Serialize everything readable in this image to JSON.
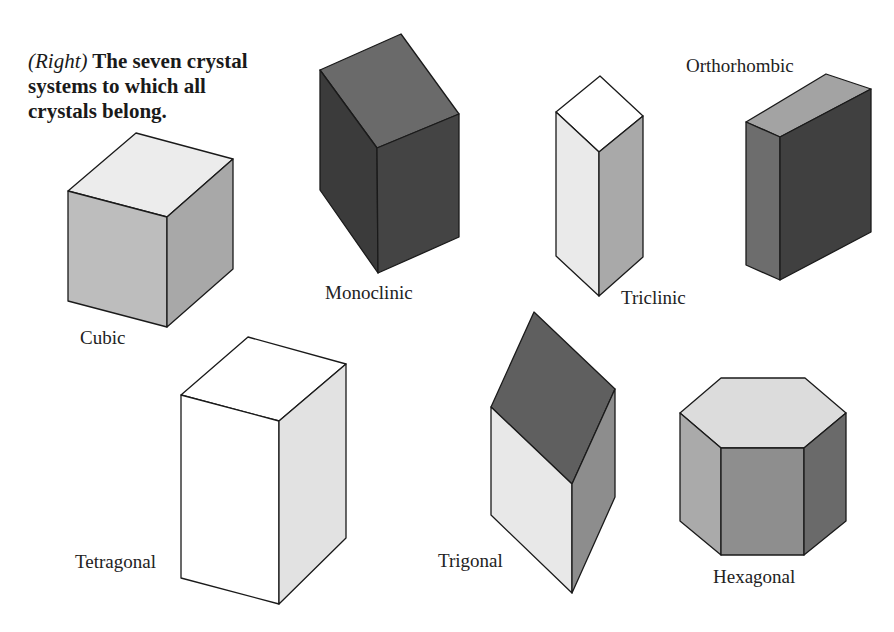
{
  "caption": {
    "lead": "(Right)",
    "text": " The seven crystal systems to which all crystals belong."
  },
  "colors": {
    "outline": "#1a1a1a",
    "background": "#ffffff"
  },
  "crystals": [
    {
      "name": "Cubic",
      "label_pos": [
        80,
        327
      ],
      "faces": [
        {
          "role": "top",
          "fill": "#ececec",
          "points": "136,133 233,159 167,217 68,191"
        },
        {
          "role": "left",
          "fill": "#bdbdbd",
          "points": "68,191 167,217 167,327 68,301"
        },
        {
          "role": "right",
          "fill": "#a8a8a8",
          "points": "167,217 233,159 233,269 167,327"
        }
      ]
    },
    {
      "name": "Monoclinic",
      "label_pos": [
        325,
        282
      ],
      "faces": [
        {
          "role": "top",
          "fill": "#6a6a6a",
          "points": "401,34 459,114 377,148 320,70"
        },
        {
          "role": "left",
          "fill": "#3b3b3b",
          "points": "320,70 377,148 378,273 320,190"
        },
        {
          "role": "right",
          "fill": "#444444",
          "points": "377,148 459,114 459,237 378,273"
        }
      ]
    },
    {
      "name": "Triclinic",
      "label_pos": [
        621,
        287
      ],
      "faces": [
        {
          "role": "top",
          "fill": "#ffffff",
          "points": "600,76 643,116 599,152 556,112"
        },
        {
          "role": "left",
          "fill": "#eaeaea",
          "points": "556,112 599,152 599,296 556,256"
        },
        {
          "role": "right",
          "fill": "#a9a9a9",
          "points": "599,152 643,116 643,257 599,296"
        }
      ]
    },
    {
      "name": "Orthorhombic",
      "label_pos": [
        686,
        55
      ],
      "faces": [
        {
          "role": "top",
          "fill": "#a3a3a3",
          "points": "826,74 871,89 780,137 746,122"
        },
        {
          "role": "left",
          "fill": "#6d6d6d",
          "points": "746,122 780,137 780,280 746,265"
        },
        {
          "role": "front",
          "fill": "#404040",
          "points": "780,137 871,89 871,232 780,280"
        }
      ]
    },
    {
      "name": "Tetragonal",
      "label_pos": [
        75,
        551
      ],
      "faces": [
        {
          "role": "top",
          "fill": "#ffffff",
          "points": "248,337 346,364 279,421 181,395"
        },
        {
          "role": "left",
          "fill": "#ffffff",
          "points": "181,395 279,421 279,604 181,578"
        },
        {
          "role": "right",
          "fill": "#e2e2e2",
          "points": "279,421 346,364 346,538 279,604"
        }
      ]
    },
    {
      "name": "Trigonal",
      "label_pos": [
        438,
        550
      ],
      "faces": [
        {
          "role": "top",
          "fill": "#5f5f5f",
          "points": "534,312 615,389 572,484 491,407"
        },
        {
          "role": "left",
          "fill": "#e8e8e8",
          "points": "491,407 572,484 572,593 491,515"
        },
        {
          "role": "right",
          "fill": "#8d8d8d",
          "points": "572,484 615,389 615,497 572,593"
        }
      ]
    },
    {
      "name": "Hexagonal",
      "label_pos": [
        713,
        566
      ],
      "faces": [
        {
          "role": "top",
          "fill": "#dcdcdc",
          "points": "721,378 805,378 846,413 804,448 721,448 680,413"
        },
        {
          "role": "left",
          "fill": "#aaaaaa",
          "points": "680,413 721,448 721,555 680,521"
        },
        {
          "role": "front",
          "fill": "#8e8e8e",
          "points": "721,448 804,448 804,555 721,555"
        },
        {
          "role": "right",
          "fill": "#6a6a6a",
          "points": "804,448 846,413 846,521 804,555"
        }
      ]
    }
  ]
}
